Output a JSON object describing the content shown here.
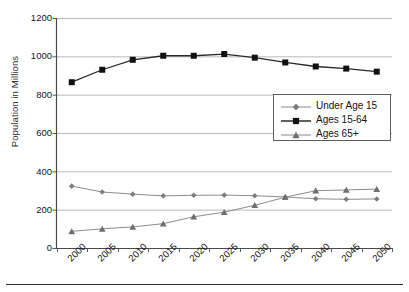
{
  "chart_data": {
    "type": "line",
    "title": "",
    "xlabel": "",
    "ylabel": "Population in Millions",
    "categories": [
      "2000",
      "2005",
      "2010",
      "2015",
      "2020",
      "2025",
      "2030",
      "2035",
      "2040",
      "2045",
      "2050"
    ],
    "ylim": [
      0,
      1200
    ],
    "yticks": [
      0,
      200,
      400,
      600,
      800,
      1000,
      1200
    ],
    "grid": "horizontal",
    "legend_position": "center-right",
    "series": [
      {
        "name": "Under Age 15",
        "marker": "diamond",
        "color": "#7d7d7d",
        "values": [
          323,
          292,
          281,
          272,
          275,
          276,
          273,
          266,
          257,
          254,
          256
        ]
      },
      {
        "name": "Ages 15-64",
        "marker": "square",
        "color": "#1a1a1a",
        "values": [
          865,
          930,
          982,
          1003,
          1003,
          1012,
          993,
          968,
          947,
          936,
          920
        ]
      },
      {
        "name": "Ages 65+",
        "marker": "triangle",
        "color": "#6e6e6e",
        "values": [
          87,
          100,
          110,
          127,
          163,
          187,
          223,
          265,
          299,
          303,
          307
        ]
      }
    ]
  },
  "axis": {
    "y_title": "Population in Millions",
    "y_tick_labels": [
      "1200",
      "1000",
      "800",
      "600",
      "400",
      "200",
      "0"
    ],
    "x_tick_labels": [
      "2000",
      "2005",
      "2010",
      "2015",
      "2020",
      "2025",
      "2030",
      "2035",
      "2040",
      "2045",
      "2050"
    ]
  },
  "legend": {
    "items": [
      {
        "label": "Under Age 15",
        "marker": "diamond-marker",
        "color": "#7d7d7d"
      },
      {
        "label": "Ages 15-64",
        "marker": "square-marker",
        "color": "#1a1a1a"
      },
      {
        "label": "Ages 65+",
        "marker": "triangle-marker",
        "color": "#6e6e6e"
      }
    ]
  },
  "footer": {
    "caption_clipped": ""
  },
  "colors": {
    "gridline": "#b9b9b9",
    "axis": "#4a4a4a",
    "plot_background": "#ffffff"
  }
}
